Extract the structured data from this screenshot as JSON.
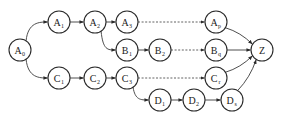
{
  "diagram": {
    "type": "directed-graph",
    "node_radius": 11,
    "colors": {
      "stroke": "#2a2a2a",
      "fill": "#ffffff",
      "edge": "#3a3a3a",
      "background": "#ffffff"
    },
    "nodes": [
      {
        "id": "A0",
        "letter": "A",
        "sub": "0",
        "x": 20,
        "y": 50
      },
      {
        "id": "A1",
        "letter": "A",
        "sub": "1",
        "x": 59,
        "y": 22
      },
      {
        "id": "A2",
        "letter": "A",
        "sub": "2",
        "x": 95,
        "y": 22
      },
      {
        "id": "A3",
        "letter": "A",
        "sub": "3",
        "x": 127,
        "y": 22
      },
      {
        "id": "Ap",
        "letter": "A",
        "sub": "p",
        "x": 216,
        "y": 22
      },
      {
        "id": "B1",
        "letter": "B",
        "sub": "1",
        "x": 127,
        "y": 50
      },
      {
        "id": "B2",
        "letter": "B",
        "sub": "2",
        "x": 160,
        "y": 50
      },
      {
        "id": "Bq",
        "letter": "B",
        "sub": "q",
        "x": 216,
        "y": 50
      },
      {
        "id": "Z",
        "letter": "Z",
        "sub": "",
        "x": 262,
        "y": 50
      },
      {
        "id": "C1",
        "letter": "C",
        "sub": "1",
        "x": 59,
        "y": 78
      },
      {
        "id": "C2",
        "letter": "C",
        "sub": "2",
        "x": 95,
        "y": 78
      },
      {
        "id": "C3",
        "letter": "C",
        "sub": "3",
        "x": 127,
        "y": 78
      },
      {
        "id": "Cr",
        "letter": "C",
        "sub": "r",
        "x": 216,
        "y": 78
      },
      {
        "id": "D1",
        "letter": "D",
        "sub": "1",
        "x": 160,
        "y": 100
      },
      {
        "id": "D2",
        "letter": "D",
        "sub": "2",
        "x": 194,
        "y": 100
      },
      {
        "id": "Ds",
        "letter": "D",
        "sub": "s",
        "x": 232,
        "y": 100
      }
    ],
    "edges": [
      {
        "from": "A0",
        "to": "A1",
        "style": "solid",
        "curve": "up"
      },
      {
        "from": "A0",
        "to": "C1",
        "style": "solid",
        "curve": "down"
      },
      {
        "from": "A1",
        "to": "A2",
        "style": "solid",
        "curve": "none"
      },
      {
        "from": "A2",
        "to": "A3",
        "style": "solid",
        "curve": "none"
      },
      {
        "from": "A3",
        "to": "Ap",
        "style": "dashed",
        "curve": "none"
      },
      {
        "from": "A2",
        "to": "B1",
        "style": "solid",
        "curve": "down"
      },
      {
        "from": "B1",
        "to": "B2",
        "style": "solid",
        "curve": "none"
      },
      {
        "from": "B2",
        "to": "Bq",
        "style": "dashed",
        "curve": "none"
      },
      {
        "from": "C1",
        "to": "C2",
        "style": "solid",
        "curve": "none"
      },
      {
        "from": "C2",
        "to": "C3",
        "style": "solid",
        "curve": "none"
      },
      {
        "from": "C3",
        "to": "Cr",
        "style": "dashed",
        "curve": "none"
      },
      {
        "from": "C3",
        "to": "D1",
        "style": "solid",
        "curve": "down"
      },
      {
        "from": "D1",
        "to": "D2",
        "style": "solid",
        "curve": "none"
      },
      {
        "from": "D2",
        "to": "Ds",
        "style": "solid",
        "curve": "none"
      },
      {
        "from": "Ap",
        "to": "Z",
        "style": "solid",
        "curve": "z"
      },
      {
        "from": "Bq",
        "to": "Z",
        "style": "solid",
        "curve": "none"
      },
      {
        "from": "Cr",
        "to": "Z",
        "style": "solid",
        "curve": "z"
      },
      {
        "from": "Ds",
        "to": "Z",
        "style": "solid",
        "curve": "z"
      }
    ]
  }
}
